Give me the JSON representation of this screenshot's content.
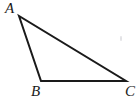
{
  "figure": {
    "kind": "geometry-diagram",
    "shape": "triangle",
    "background_color": "#ffffff",
    "stroke_color": "#1a1a1a",
    "stroke_width": 2,
    "label_color": "#1a1a1a",
    "canvas": {
      "width": 139,
      "height": 104
    }
  },
  "triangle": {
    "name": "ABC",
    "vertices": [
      {
        "id": "A",
        "label": "A",
        "x": 19,
        "y": 16,
        "label_x": 5,
        "label_y": 1
      },
      {
        "id": "B",
        "label": "B",
        "x": 41,
        "y": 81,
        "label_x": 31,
        "label_y": 84
      },
      {
        "id": "C",
        "label": "C",
        "x": 126,
        "y": 81,
        "label_x": 125,
        "label_y": 84
      }
    ],
    "edges": [
      {
        "id": "AB",
        "from": "A",
        "to": "B"
      },
      {
        "id": "BC",
        "from": "B",
        "to": "C"
      },
      {
        "id": "CA",
        "from": "C",
        "to": "A"
      }
    ],
    "path": "M 19 16 L 41 81 L 126 81 Z"
  },
  "artifacts": [
    {
      "id": "speck-right",
      "type": "scan-speck",
      "x": 120,
      "y": 36,
      "color": "#d8d8dc"
    }
  ]
}
